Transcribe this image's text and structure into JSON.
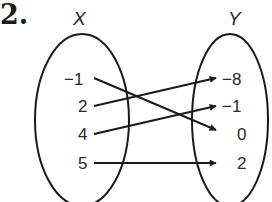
{
  "problem": {
    "number": "2."
  },
  "domain_set": {
    "title": "X",
    "values": [
      "−1",
      "2",
      "4",
      "5"
    ]
  },
  "range_set": {
    "title": "Y",
    "values": [
      "−8",
      "−1",
      "0",
      "2"
    ]
  },
  "mappings": [
    {
      "from": "−1",
      "to": "0"
    },
    {
      "from": "2",
      "to": "−8"
    },
    {
      "from": "4",
      "to": "−1"
    },
    {
      "from": "5",
      "to": "2"
    }
  ],
  "colors": {
    "stroke": "#1a1a1a",
    "text": "#2a2a2a",
    "background": "#ffffff"
  }
}
